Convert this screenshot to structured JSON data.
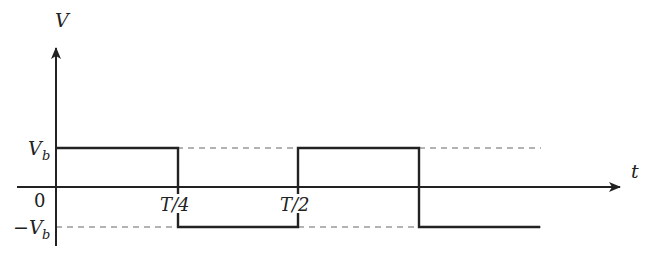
{
  "diagram": {
    "type": "square-wave voltage vs time",
    "axes": {
      "y_label": "V",
      "x_label": "t",
      "origin_label": "0"
    },
    "levels": {
      "high_label": "V",
      "high_sub": "b",
      "low_label": "−V",
      "low_sub": "b"
    },
    "x_ticks": [
      {
        "label": "T/4"
      },
      {
        "label": "T/2"
      }
    ],
    "waveform": {
      "segments": [
        {
          "from": "0",
          "to": "T/4",
          "level": "+Vb"
        },
        {
          "from": "T/4",
          "to": "T/2",
          "level": "-Vb"
        },
        {
          "from": "T/2",
          "to": "3T/4",
          "level": "+Vb"
        },
        {
          "from": "3T/4",
          "to": "end",
          "level": "-Vb"
        }
      ]
    },
    "colors": {
      "line": "#222222",
      "dashed": "#555555"
    }
  }
}
